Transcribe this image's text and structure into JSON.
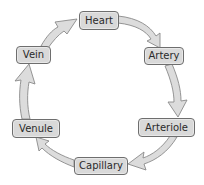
{
  "diagram": {
    "type": "cycle",
    "title": "",
    "nodes": [
      {
        "id": "heart",
        "label": "Heart"
      },
      {
        "id": "artery",
        "label": "Artery"
      },
      {
        "id": "arteriole",
        "label": "Arteriole"
      },
      {
        "id": "capillary",
        "label": "Capillary"
      },
      {
        "id": "venule",
        "label": "Venule"
      },
      {
        "id": "vein",
        "label": "Vein"
      }
    ],
    "edges": [
      {
        "from": "heart",
        "to": "artery"
      },
      {
        "from": "artery",
        "to": "arteriole"
      },
      {
        "from": "arteriole",
        "to": "capillary"
      },
      {
        "from": "capillary",
        "to": "venule"
      },
      {
        "from": "venule",
        "to": "vein"
      },
      {
        "from": "vein",
        "to": "heart"
      }
    ],
    "colors": {
      "node_fill": "#d9d9d9",
      "node_border": "#6e6e6e",
      "arrow_fill": "#dcdcdc",
      "arrow_stroke": "#8a8a8a",
      "text": "#2a2a2a"
    }
  }
}
